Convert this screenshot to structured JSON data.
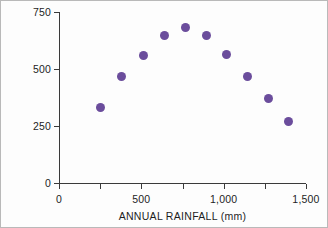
{
  "chart_data": {
    "type": "scatter",
    "title": "",
    "xlabel": "ANNUAL RAINFALL  (mm)",
    "ylabel": "KILOGRAMS PER HECTARE",
    "xlim": [
      0,
      1500
    ],
    "ylim": [
      0,
      750
    ],
    "grid": false,
    "legend": "none",
    "marker_color": "#6b4d9c",
    "axis_color": "#3a3a3a",
    "xticks": [
      0,
      250,
      500,
      750,
      1000,
      1250,
      1500
    ],
    "xtick_labels": [
      "0",
      "",
      "500",
      "",
      "1,000",
      "",
      "1,500"
    ],
    "yticks": [
      0,
      250,
      500,
      750
    ],
    "ytick_labels": [
      "0",
      "250",
      "500",
      "750"
    ],
    "x": [
      250,
      380,
      515,
      640,
      770,
      895,
      1020,
      1145,
      1270,
      1395
    ],
    "values": [
      330,
      465,
      560,
      645,
      680,
      645,
      565,
      465,
      370,
      270
    ],
    "points": [
      {
        "x": 250,
        "y": 330
      },
      {
        "x": 380,
        "y": 465
      },
      {
        "x": 515,
        "y": 560
      },
      {
        "x": 640,
        "y": 645
      },
      {
        "x": 770,
        "y": 680
      },
      {
        "x": 895,
        "y": 645
      },
      {
        "x": 1020,
        "y": 565
      },
      {
        "x": 1145,
        "y": 465
      },
      {
        "x": 1270,
        "y": 370
      },
      {
        "x": 1395,
        "y": 270
      }
    ]
  }
}
